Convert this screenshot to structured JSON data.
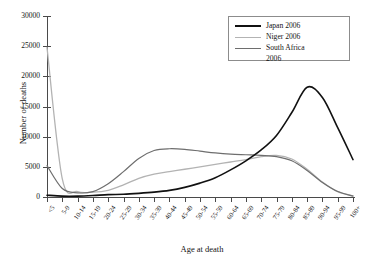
{
  "chart_data": {
    "type": "line",
    "title": "",
    "xlabel": "Age at death",
    "ylabel": "Number of deaths",
    "ylim": [
      0,
      30000
    ],
    "ytick_values": [
      0,
      5000,
      10000,
      15000,
      20000,
      25000,
      30000
    ],
    "ytick_labels": [
      "0",
      "5000",
      "10000",
      "15000",
      "20000",
      "25000",
      "30000"
    ],
    "grid": false,
    "legend_position": "top-right",
    "categories": [
      "<5",
      "5-9",
      "10-14",
      "15-19",
      "20-24",
      "25-29",
      "30-34",
      "35-39",
      "40-44",
      "45-49",
      "50-54",
      "55-59",
      "60-64",
      "65-69",
      "70-74",
      "75-79",
      "80-84",
      "85-89",
      "90-94",
      "95-99",
      "100+"
    ],
    "series": [
      {
        "name": "Japan 2006",
        "color": "#111111",
        "width": 1.6,
        "values": [
          300,
          150,
          150,
          250,
          400,
          450,
          600,
          800,
          1100,
          1600,
          2300,
          3200,
          4500,
          6000,
          7800,
          10200,
          14000,
          18200,
          16500,
          11500,
          6200
        ]
      },
      {
        "name": "Niger 2006",
        "color": "#b3b3b3",
        "width": 1.3,
        "values": [
          24800,
          3000,
          900,
          800,
          1100,
          2000,
          3100,
          3800,
          4200,
          4600,
          5000,
          5400,
          5800,
          6200,
          6700,
          6900,
          6300,
          4600,
          2500,
          900,
          200
        ]
      },
      {
        "name": "South Africa 2006",
        "color": "#6e6e6e",
        "width": 1.2,
        "values": [
          5200,
          1400,
          700,
          900,
          2200,
          4200,
          6400,
          7700,
          8000,
          7900,
          7600,
          7300,
          7100,
          7000,
          6900,
          6700,
          6000,
          4400,
          2400,
          900,
          150
        ]
      }
    ]
  },
  "legend": {
    "entries": [
      {
        "label": "Japan 2006"
      },
      {
        "label": "Niger 2006"
      },
      {
        "label": "South Africa\n2006"
      }
    ]
  }
}
